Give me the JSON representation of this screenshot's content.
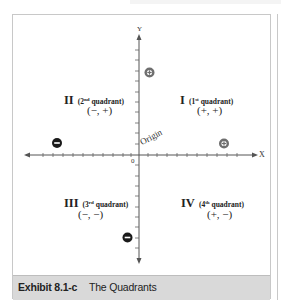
{
  "exhibit": {
    "number": "Exhibit 8.1-c",
    "title": "The Quadrants"
  },
  "axes": {
    "x_label": "X",
    "y_label": "Y",
    "origin_label": "Origin",
    "zero_label": "0",
    "x_ticks_left": 10,
    "x_ticks_right": 10,
    "y_ticks_up": 10,
    "y_ticks_down": 10
  },
  "quadrants": [
    {
      "numeral": "I",
      "ordinal": "1",
      "ordinal_suffix": "st",
      "word": "quadrant",
      "signs": "(+, +)"
    },
    {
      "numeral": "II",
      "ordinal": "2",
      "ordinal_suffix": "nd",
      "word": "quadrant",
      "signs": "(−, +)"
    },
    {
      "numeral": "III",
      "ordinal": "3",
      "ordinal_suffix": "rd",
      "word": "quadrant",
      "signs": "(−, −)"
    },
    {
      "numeral": "IV",
      "ordinal": "4",
      "ordinal_suffix": "th",
      "word": "quadrant",
      "signs": "(+, −)"
    }
  ],
  "markers": [
    {
      "name": "plus-marker-y-axis",
      "symbol": "plus",
      "axis": "y",
      "side": "positive",
      "color": "#6e6e6e"
    },
    {
      "name": "minus-marker-x-axis",
      "symbol": "minus",
      "axis": "x",
      "side": "negative",
      "color": "#1a1a1a"
    },
    {
      "name": "plus-marker-x-axis",
      "symbol": "plus",
      "axis": "x",
      "side": "positive",
      "color": "#6e6e6e"
    },
    {
      "name": "minus-marker-y-axis",
      "symbol": "minus",
      "axis": "y",
      "side": "negative",
      "color": "#1a1a1a"
    }
  ],
  "colors": {
    "caption_bg": "#d9d9d9",
    "axis": "#555555",
    "frame": "#c8c8c8"
  }
}
